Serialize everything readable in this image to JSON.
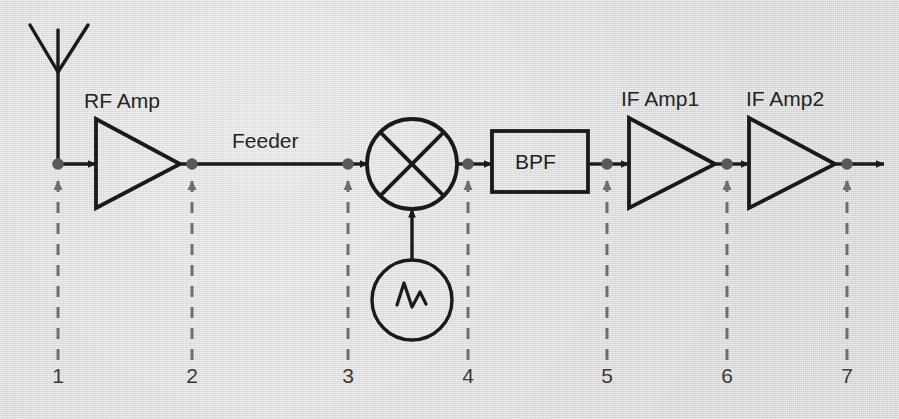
{
  "diagram": {
    "background_color": "#dcdcdc",
    "line_color": "#1a1a1a",
    "node_color": "#595959",
    "dashed_color": "#6e6e6e",
    "text_color": "#242424"
  },
  "blocks": {
    "antenna": {
      "name": "antenna",
      "label": ""
    },
    "rf_amp": {
      "label": "RF Amp",
      "type": "triangle-amplifier"
    },
    "feeder": {
      "label": "Feeder",
      "type": "transmission-line"
    },
    "mixer": {
      "label": "",
      "type": "mixer-circle-x"
    },
    "local_oscillator": {
      "label": "",
      "type": "oscillator-circle-sine"
    },
    "bpf": {
      "label": "BPF",
      "type": "rectangle-filter"
    },
    "if_amp1": {
      "label": "IF Amp1",
      "type": "triangle-amplifier"
    },
    "if_amp2": {
      "label": "IF Amp2",
      "type": "triangle-amplifier"
    }
  },
  "labels": {
    "rf_amp": "RF Amp",
    "feeder": "Feeder",
    "bpf": "BPF",
    "if_amp1": "IF Amp1",
    "if_amp2": "IF Amp2"
  },
  "nodes": [
    {
      "id": 1,
      "number": "1",
      "x": 58
    },
    {
      "id": 2,
      "number": "2",
      "x": 192
    },
    {
      "id": 3,
      "number": "3",
      "x": 348
    },
    {
      "id": 4,
      "number": "4",
      "x": 468
    },
    {
      "id": 5,
      "number": "5",
      "x": 607
    },
    {
      "id": 6,
      "number": "6",
      "x": 727
    },
    {
      "id": 7,
      "number": "7",
      "x": 847
    }
  ],
  "node_numbers": [
    "1",
    "2",
    "3",
    "4",
    "5",
    "6",
    "7"
  ]
}
